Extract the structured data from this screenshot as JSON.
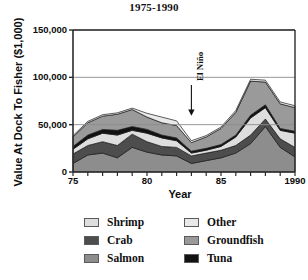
{
  "chart_data": {
    "type": "area",
    "title": "1975-1990",
    "xlabel": "Year",
    "ylabel": "Value At Dock To Fisher ($1,000)",
    "stacked": true,
    "grid": true,
    "legend_position": "bottom",
    "xlim": [
      75,
      90
    ],
    "ylim": [
      0,
      150000
    ],
    "yticks": [
      0,
      50000,
      100000,
      150000
    ],
    "ytick_labels": [
      "0",
      "50,000",
      "100,000",
      "150,000"
    ],
    "xticks": [
      75,
      76,
      77,
      78,
      79,
      80,
      81,
      82,
      83,
      84,
      85,
      86,
      87,
      88,
      89,
      90
    ],
    "xtick_labels": [
      {
        "value": 75,
        "label": "75"
      },
      {
        "value": 80,
        "label": "80"
      },
      {
        "value": 85,
        "label": "85"
      },
      {
        "value": 90,
        "label": "1990"
      }
    ],
    "x": [
      1975,
      1976,
      1977,
      1978,
      1979,
      1980,
      1981,
      1982,
      1983,
      1984,
      1985,
      1986,
      1987,
      1988,
      1989,
      1990
    ],
    "series": [
      {
        "name": "Salmon",
        "color": "#8d8d8d",
        "values": [
          9000,
          18000,
          20000,
          15000,
          26000,
          21000,
          18000,
          17000,
          9000,
          12000,
          15000,
          20000,
          30000,
          48000,
          26000,
          16000
        ]
      },
      {
        "name": "Crab",
        "color": "#4d4d4d",
        "values": [
          10000,
          10000,
          12000,
          13000,
          14000,
          11000,
          9000,
          9000,
          8000,
          8000,
          8000,
          8000,
          9000,
          8000,
          9000,
          10000
        ]
      },
      {
        "name": "Shrimp",
        "color": "#dedede",
        "values": [
          5000,
          7000,
          9000,
          11000,
          4000,
          9000,
          9000,
          7000,
          3000,
          3000,
          4000,
          9000,
          18000,
          12000,
          9000,
          15000
        ]
      },
      {
        "name": "Tuna",
        "color": "#121212",
        "values": [
          3000,
          4000,
          4000,
          5000,
          4000,
          4000,
          3000,
          3000,
          2000,
          2000,
          2000,
          2000,
          3000,
          3000,
          2000,
          2000
        ]
      },
      {
        "name": "Groundfish",
        "color": "#9a9a9a",
        "values": [
          10000,
          13000,
          14000,
          17000,
          18000,
          13000,
          13000,
          13000,
          9000,
          12000,
          17000,
          24000,
          36000,
          24000,
          26000,
          25000
        ]
      },
      {
        "name": "Other",
        "color": "#e9e9e9",
        "values": [
          1500,
          1500,
          1500,
          1500,
          1500,
          4000,
          6000,
          5000,
          2000,
          1500,
          1500,
          2000,
          2000,
          2000,
          2000,
          2000
        ]
      }
    ],
    "annotations": [
      {
        "name": "el-nino",
        "label": "El Niño",
        "x": 83,
        "arrow": "down"
      }
    ]
  },
  "legend": {
    "entries": [
      {
        "label": "Shrimp",
        "color": "#dedede"
      },
      {
        "label": "Other",
        "color": "#e9e9e9"
      },
      {
        "label": "Crab",
        "color": "#4d4d4d"
      },
      {
        "label": "Groundfish",
        "color": "#9a9a9a"
      },
      {
        "label": "Salmon",
        "color": "#8d8d8d"
      },
      {
        "label": "Tuna",
        "color": "#121212"
      }
    ]
  },
  "colors": {
    "axis": "#2b2b2b",
    "grid": "#8c8c8c",
    "background": "#ffffff",
    "outline": "#1a1a1a"
  }
}
